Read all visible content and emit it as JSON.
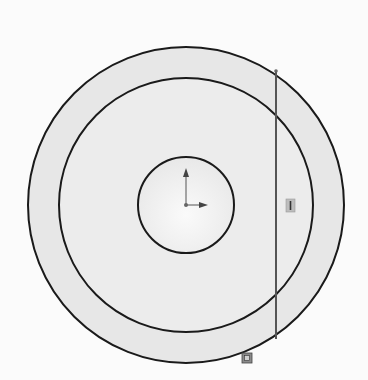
{
  "diagram": {
    "type": "cad-sketch",
    "background": "#fbfbfb",
    "region_fill": "#e9e9e9",
    "inner_fill": "#f1f1f1",
    "stroke": "#1a1a1a",
    "line_color": "#555555",
    "outer_circle": {
      "cx": 186,
      "cy": 205,
      "r": 158
    },
    "middle_circle": {
      "cx": 186,
      "cy": 205,
      "r": 127
    },
    "inner_circle": {
      "cx": 186,
      "cy": 205,
      "r": 48
    },
    "vertical_line": {
      "x": 276,
      "y1": 71,
      "y2": 339
    },
    "origin": {
      "x": 186,
      "y": 205
    },
    "relations": [
      {
        "name": "vertical-relation",
        "x": 290,
        "y": 206,
        "glyph": "|"
      },
      {
        "name": "coincident-relation",
        "x": 246,
        "y": 359,
        "glyph": "▣"
      }
    ]
  }
}
